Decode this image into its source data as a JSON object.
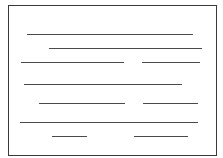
{
  "figure": {
    "kind": "schematic-text-block",
    "width": 223,
    "height": 158,
    "background": "#ffffff",
    "frame": {
      "x": 8,
      "y": 5,
      "width": 209,
      "height": 151,
      "border_width": 1,
      "color": "#3a3a3a"
    },
    "line_color": "#4a4a4a",
    "line_thickness": 1,
    "rows": [
      {
        "y": 34,
        "segments": [
          {
            "x1": 27,
            "x2": 193
          }
        ]
      },
      {
        "y": 48,
        "segments": [
          {
            "x1": 49,
            "x2": 202
          }
        ]
      },
      {
        "y": 62,
        "segments": [
          {
            "x1": 21,
            "x2": 124
          },
          {
            "x1": 142,
            "x2": 200
          }
        ]
      },
      {
        "y": 84,
        "segments": [
          {
            "x1": 24,
            "x2": 182
          }
        ]
      },
      {
        "y": 103,
        "segments": [
          {
            "x1": 39,
            "x2": 125
          },
          {
            "x1": 143,
            "x2": 198
          }
        ]
      },
      {
        "y": 122,
        "segments": [
          {
            "x1": 20,
            "x2": 198
          }
        ]
      },
      {
        "y": 136,
        "segments": [
          {
            "x1": 52,
            "x2": 87
          },
          {
            "x1": 134,
            "x2": 188
          }
        ]
      }
    ]
  }
}
